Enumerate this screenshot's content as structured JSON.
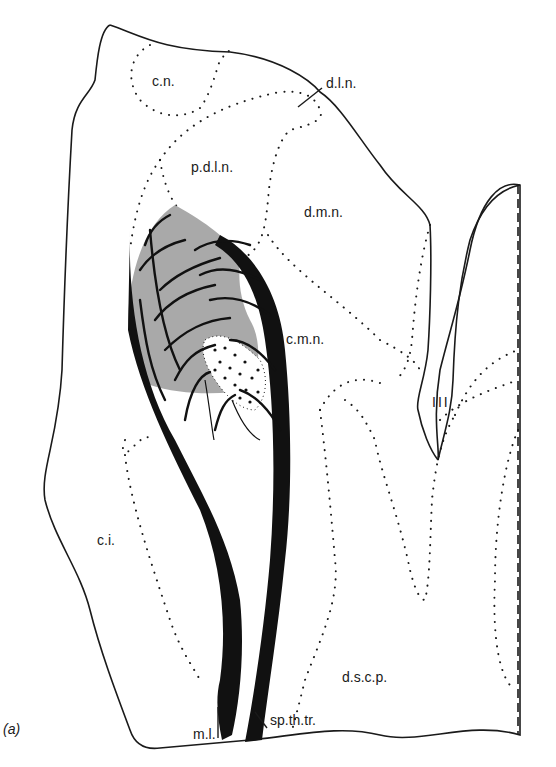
{
  "figure": {
    "panel_label": "(a)",
    "colors": {
      "outline": "#1a1a1a",
      "shading": "#9a9a9a",
      "fibres": "#111111",
      "background": "#ffffff"
    }
  },
  "labels": {
    "cn": "c.n.",
    "dln": "d.l.n.",
    "pdln": "p.d.l.n.",
    "dmn": "d.m.n.",
    "cmn": "c.m.n.",
    "iii": "III",
    "ci": "c.i.",
    "dscp": "d.s.c.p.",
    "ml": "m.l.",
    "spthtr": "sp.th.tr."
  }
}
